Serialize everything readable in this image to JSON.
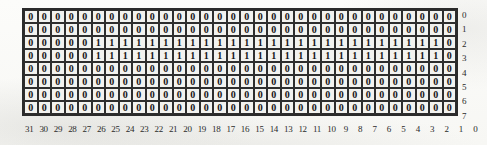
{
  "figure": {
    "kind": "bit-matrix",
    "background_color": "#fcfcfa",
    "cell_fill_color": "#f2f2ef",
    "border_color": "#2e2e2e",
    "text_color": "#141414",
    "label_color": "#2a2a2a",
    "row_count": 8,
    "col_count": 32
  },
  "chart_data": {
    "type": "table",
    "title": "",
    "xlabel": "",
    "ylabel": "",
    "grid": true,
    "legend": null,
    "orientation": "bit numbering descends left-to-right (MSB 31 at left, LSB 0 at right)",
    "row_labels": [
      "0",
      "1",
      "2",
      "3",
      "4",
      "5",
      "6",
      "7"
    ],
    "col_labels": [
      "31",
      "30",
      "29",
      "28",
      "27",
      "26",
      "25",
      "24",
      "23",
      "22",
      "21",
      "20",
      "19",
      "18",
      "17",
      "16",
      "15",
      "14",
      "13",
      "12",
      "11",
      "10",
      "9",
      "8",
      "7",
      "6",
      "5",
      "4",
      "3",
      "2",
      "1",
      "0"
    ],
    "rows": [
      {
        "label": "0",
        "cells": [
          "0",
          "0",
          "0",
          "0",
          "0",
          "0",
          "0",
          "0",
          "0",
          "0",
          "0",
          "0",
          "0",
          "0",
          "0",
          "0",
          "0",
          "0",
          "0",
          "0",
          "0",
          "0",
          "0",
          "0",
          "0",
          "0",
          "0",
          "0",
          "0",
          "0",
          "0",
          "0"
        ]
      },
      {
        "label": "1",
        "cells": [
          "0",
          "0",
          "0",
          "0",
          "0",
          "0",
          "0",
          "0",
          "0",
          "0",
          "0",
          "0",
          "0",
          "0",
          "0",
          "0",
          "0",
          "0",
          "0",
          "0",
          "0",
          "0",
          "0",
          "0",
          "0",
          "0",
          "0",
          "0",
          "0",
          "0",
          "0",
          "0"
        ]
      },
      {
        "label": "2",
        "cells": [
          "0",
          "0",
          "0",
          "0",
          "0",
          "1",
          "1",
          "1",
          "1",
          "1",
          "1",
          "1",
          "1",
          "1",
          "1",
          "1",
          "1",
          "1",
          "1",
          "1",
          "1",
          "1",
          "1",
          "1",
          "1",
          "1",
          "1",
          "1",
          "1",
          "1",
          "1",
          "0"
        ]
      },
      {
        "label": "3",
        "cells": [
          "0",
          "0",
          "0",
          "0",
          "0",
          "1",
          "1",
          "1",
          "1",
          "1",
          "1",
          "1",
          "1",
          "1",
          "1",
          "1",
          "1",
          "1",
          "1",
          "1",
          "1",
          "1",
          "1",
          "1",
          "1",
          "1",
          "1",
          "1",
          "1",
          "1",
          "1",
          "0"
        ]
      },
      {
        "label": "4",
        "cells": [
          "0",
          "0",
          "0",
          "0",
          "0",
          "0",
          "0",
          "0",
          "0",
          "0",
          "0",
          "0",
          "0",
          "0",
          "0",
          "0",
          "0",
          "0",
          "0",
          "0",
          "0",
          "0",
          "0",
          "0",
          "0",
          "0",
          "0",
          "0",
          "0",
          "0",
          "0",
          "0"
        ]
      },
      {
        "label": "5",
        "cells": [
          "0",
          "0",
          "0",
          "0",
          "0",
          "0",
          "0",
          "0",
          "0",
          "0",
          "0",
          "0",
          "0",
          "0",
          "0",
          "0",
          "0",
          "0",
          "0",
          "0",
          "0",
          "0",
          "0",
          "0",
          "0",
          "0",
          "0",
          "0",
          "0",
          "0",
          "0",
          "0"
        ]
      },
      {
        "label": "6",
        "cells": [
          "0",
          "0",
          "0",
          "0",
          "0",
          "0",
          "0",
          "0",
          "0",
          "0",
          "0",
          "0",
          "0",
          "0",
          "0",
          "0",
          "0",
          "0",
          "0",
          "0",
          "0",
          "0",
          "0",
          "0",
          "0",
          "0",
          "0",
          "0",
          "0",
          "0",
          "0",
          "0"
        ]
      },
      {
        "label": "7",
        "cells": [
          "0",
          "0",
          "0",
          "0",
          "0",
          "0",
          "0",
          "0",
          "0",
          "0",
          "0",
          "0",
          "0",
          "0",
          "0",
          "0",
          "0",
          "0",
          "0",
          "0",
          "0",
          "0",
          "0",
          "0",
          "0",
          "0",
          "0",
          "0",
          "0",
          "0",
          "0",
          "0"
        ]
      }
    ]
  }
}
